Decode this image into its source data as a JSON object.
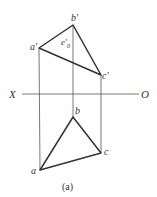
{
  "diagram": {
    "caption": "(a)",
    "axis": {
      "left_label": "X",
      "right_label": "O"
    },
    "front_view": {
      "points": {
        "a_prime": {
          "label": "a′",
          "x": 39,
          "y": 48
        },
        "b_prime": {
          "label": "b′",
          "x": 73,
          "y": 25
        },
        "c_prime": {
          "label": "c′",
          "x": 101,
          "y": 75
        }
      },
      "inner_point": {
        "label": "e′",
        "sub": "0"
      }
    },
    "top_view": {
      "points": {
        "a": {
          "label": "a",
          "x": 40,
          "y": 170
        },
        "b": {
          "label": "b",
          "x": 73,
          "y": 117
        },
        "c": {
          "label": "c",
          "x": 101,
          "y": 153
        }
      }
    },
    "colors": {
      "line": "#333333",
      "thin": "#555555"
    }
  }
}
